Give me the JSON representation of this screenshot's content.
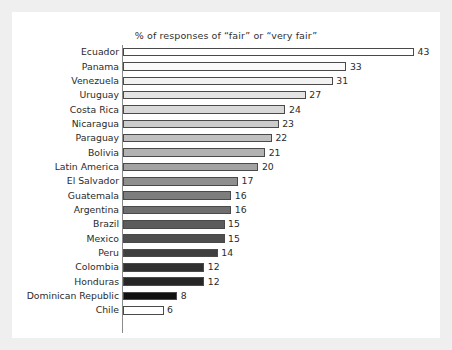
{
  "chart_data": {
    "type": "bar",
    "orientation": "horizontal",
    "title": "% of responses of “fair” or “very fair”",
    "xlabel": "",
    "ylabel": "",
    "xlim": [
      0,
      43
    ],
    "grid": false,
    "legend": null,
    "axis_line": "left",
    "value_labels": true,
    "categories": [
      "Ecuador",
      "Panama",
      "Venezuela",
      "Uruguay",
      "Costa Rica",
      "Nicaragua",
      "Paraguay",
      "Bolivia",
      "Latin America",
      "El Salvador",
      "Guatemala",
      "Argentina",
      "Brazil",
      "Mexico",
      "Peru",
      "Colombia",
      "Honduras",
      "Dominican Republic",
      "Chile"
    ],
    "values": [
      43,
      33,
      31,
      27,
      24,
      23,
      22,
      21,
      20,
      17,
      16,
      16,
      15,
      15,
      14,
      12,
      12,
      8,
      6
    ],
    "bar_colors": [
      "#ffffff",
      "#fbfbfb",
      "#f2f2f2",
      "#e4e4e4",
      "#d8d8d8",
      "#cccccc",
      "#c0c0c0",
      "#b2b2b2",
      "#a3a3a3",
      "#8f8f8f",
      "#7d7d7d",
      "#6e6e6e",
      "#5c5c5c",
      "#4e4e4e",
      "#3f3f3f",
      "#303030",
      "#262626",
      "#111111",
      "#ffffff"
    ],
    "bar_outline_color": "#4a4a4a",
    "background_color": "#ffffff",
    "frame_color": "#efefef",
    "text_color": "#2b2b2b"
  }
}
